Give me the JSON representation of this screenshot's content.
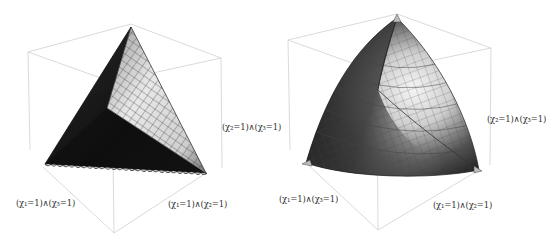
{
  "figure": {
    "panels": [
      {
        "id": "left",
        "description": "Tetrahedral surface (flat faces) inside bounding box",
        "labels": {
          "x2_and_x3": "(χ₂=1)∧(χ₃=1)",
          "x1_and_x3": "(χ₁=1)∧(χ₃=1)",
          "x1_and_x2": "(χ₁=1)∧(χ₂=1)"
        }
      },
      {
        "id": "right",
        "description": "Curved (Reuleaux-like) surface inside bounding box",
        "labels": {
          "x2_and_x3": "(χ₂=1)∧(χ₃=1)",
          "x1_and_x3": "(χ₁=1)∧(χ₃=1)",
          "x1_and_x2": "(χ₁=1)∧(χ₂=1)"
        }
      }
    ]
  }
}
